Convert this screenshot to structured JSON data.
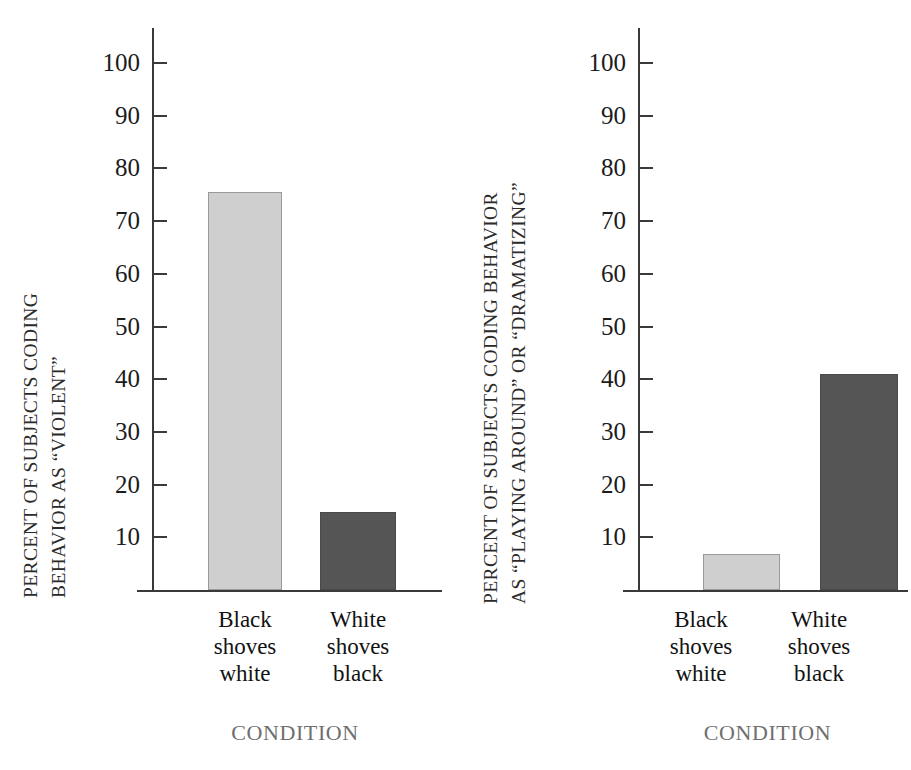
{
  "chart_data": [
    {
      "type": "bar",
      "panel": "left",
      "title": "",
      "categories": [
        "Black shoves white",
        "White shoves black"
      ],
      "category_lines": [
        [
          "Black",
          "shoves",
          "white"
        ],
        [
          "White",
          "shoves",
          "black"
        ]
      ],
      "values": [
        75.5,
        14.8
      ],
      "bar_colors": [
        "#cfcfcf",
        "#555555"
      ],
      "ylabel": "PERCENT OF SUBJECTS CODING BEHAVIOR AS “VIOLENT”",
      "ylabel_lines": [
        "PERCENT OF SUBJECTS CODING",
        "BEHAVIOR AS “VIOLENT”"
      ],
      "xlabel": "CONDITION",
      "ylim": [
        0,
        105
      ],
      "yticks": [
        10,
        20,
        30,
        40,
        50,
        60,
        70,
        80,
        90,
        100
      ],
      "ytick_labels": [
        "10",
        "20",
        "30",
        "40",
        "50",
        "60",
        "70",
        "80",
        "90",
        "100"
      ],
      "grid": false,
      "legend": "none"
    },
    {
      "type": "bar",
      "panel": "right",
      "title": "",
      "categories": [
        "Black shoves white",
        "White shoves black"
      ],
      "category_lines": [
        [
          "Black",
          "shoves",
          "white"
        ],
        [
          "White",
          "shoves",
          "black"
        ]
      ],
      "values": [
        6.8,
        41.0
      ],
      "bar_colors": [
        "#cfcfcf",
        "#555555"
      ],
      "ylabel": "PERCENT OF SUBJECTS CODING BEHAVIOR AS “PLAYING AROUND” OR “DRAMATIZING”",
      "ylabel_lines": [
        "PERCENT OF SUBJECTS CODING BEHAVIOR",
        "AS “PLAYING AROUND” OR “DRAMATIZING”"
      ],
      "xlabel": "CONDITION",
      "ylim": [
        0,
        105
      ],
      "yticks": [
        10,
        20,
        30,
        40,
        50,
        60,
        70,
        80,
        90,
        100
      ],
      "ytick_labels": [
        "10",
        "20",
        "30",
        "40",
        "50",
        "60",
        "70",
        "80",
        "90",
        "100"
      ],
      "grid": false,
      "legend": "none"
    }
  ],
  "left_panel": {
    "ylabel_line1": "PERCENT OF SUBJECTS CODING",
    "ylabel_line2": "BEHAVIOR AS “VIOLENT”",
    "xtitle": "CONDITION",
    "yticks": [
      "100",
      "90",
      "80",
      "70",
      "60",
      "50",
      "40",
      "30",
      "20",
      "10"
    ],
    "cat1_l1": "Black",
    "cat1_l2": "shoves",
    "cat1_l3": "white",
    "cat2_l1": "White",
    "cat2_l2": "shoves",
    "cat2_l3": "black"
  },
  "right_panel": {
    "ylabel_line1": "PERCENT OF SUBJECTS CODING BEHAVIOR",
    "ylabel_line2": "AS “PLAYING AROUND” OR “DRAMATIZING”",
    "xtitle": "CONDITION",
    "yticks": [
      "100",
      "90",
      "80",
      "70",
      "60",
      "50",
      "40",
      "30",
      "20",
      "10"
    ],
    "cat1_l1": "Black",
    "cat1_l2": "shoves",
    "cat1_l3": "white",
    "cat2_l1": "White",
    "cat2_l2": "shoves",
    "cat2_l3": "black"
  }
}
